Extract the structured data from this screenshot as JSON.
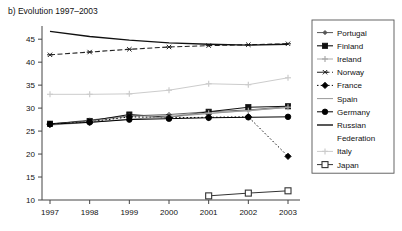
{
  "chart_data": {
    "type": "line",
    "title": "b) Evolution 1997–2003",
    "xlabel": "",
    "ylabel": "",
    "categories": [
      "1997",
      "1998",
      "1999",
      "2000",
      "2001",
      "2002",
      "2003"
    ],
    "x": [
      1997,
      1998,
      1999,
      2000,
      2001,
      2002,
      2003
    ],
    "ylim": [
      10,
      47
    ],
    "yticks": [
      10,
      15,
      20,
      25,
      30,
      35,
      40,
      45
    ],
    "ytick_labels": [
      "10",
      "15",
      "20",
      "25",
      "30",
      "35",
      "40",
      "45"
    ],
    "grid": false,
    "legend_position": "right",
    "series": [
      {
        "name": "Portugal",
        "color": "#555555",
        "marker": "diamond-small",
        "dash": "none",
        "width": 0.9,
        "values": [
          26.5,
          27.4,
          28.3,
          28.6,
          29.2,
          29.6,
          30.3
        ]
      },
      {
        "name": "Finland",
        "color": "#111111",
        "marker": "square",
        "dash": "none",
        "width": 1.1,
        "values": [
          26.6,
          27.2,
          28.6,
          28.0,
          29.2,
          30.2,
          30.4
        ]
      },
      {
        "name": "Ireland",
        "color": "#aaaaaa",
        "marker": "cross",
        "dash": "none",
        "width": 1.0,
        "values": [
          26.4,
          27.1,
          28.2,
          28.4,
          28.9,
          29.4,
          30.2
        ]
      },
      {
        "name": "Norway",
        "color": "#222222",
        "marker": "star",
        "dash": "dashed",
        "width": 1.1,
        "values": [
          41.6,
          42.2,
          42.8,
          43.3,
          43.6,
          43.8,
          44.0
        ]
      },
      {
        "name": "France",
        "color": "#000000",
        "marker": "diamond",
        "dash": "dotted",
        "width": 1.0,
        "values": [
          26.5,
          27.0,
          28.1,
          27.9,
          28.0,
          28.1,
          19.5
        ]
      },
      {
        "name": "Spain",
        "color": "#999999",
        "marker": "none",
        "dash": "none",
        "width": 1.0,
        "values": [
          26.3,
          26.9,
          27.6,
          28.1,
          28.8,
          29.5,
          30.1
        ]
      },
      {
        "name": "Germany",
        "color": "#000000",
        "marker": "circle",
        "dash": "none",
        "width": 1.0,
        "values": [
          26.5,
          26.9,
          27.5,
          27.7,
          27.9,
          28.0,
          28.1
        ]
      },
      {
        "name": "Russian Federation",
        "color": "#111111",
        "marker": "none",
        "dash": "none",
        "width": 1.4,
        "values": [
          46.7,
          45.6,
          44.8,
          44.2,
          43.9,
          43.7,
          43.9
        ]
      },
      {
        "name": "Italy",
        "color": "#cccccc",
        "marker": "cross",
        "dash": "none",
        "width": 1.0,
        "values": [
          33.0,
          33.0,
          33.1,
          33.9,
          35.3,
          35.1,
          36.6
        ]
      },
      {
        "name": "Japan",
        "color": "#333333",
        "marker": "open-square",
        "dash": "none",
        "width": 1.0,
        "values": [
          null,
          null,
          null,
          null,
          10.9,
          11.5,
          12.0
        ]
      }
    ]
  },
  "legend": {
    "items": [
      {
        "label": "Portugal"
      },
      {
        "label": "Finland"
      },
      {
        "label": "Ireland"
      },
      {
        "label": "Norway"
      },
      {
        "label": "France"
      },
      {
        "label": "Spain"
      },
      {
        "label": "Germany"
      },
      {
        "label": "Russian Federation"
      },
      {
        "label": "Italy"
      },
      {
        "label": "Japan"
      }
    ]
  }
}
